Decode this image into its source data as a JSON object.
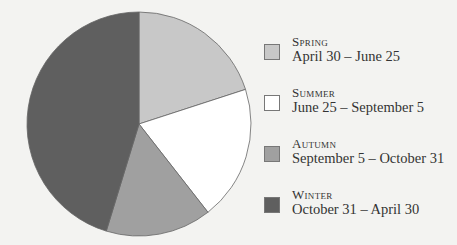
{
  "chart_data": {
    "type": "pie",
    "title": "",
    "slices": [
      {
        "name": "Spring",
        "range": "April 30 – June 25",
        "start_deg": 0,
        "end_deg": 72,
        "color": "#c8c8c8"
      },
      {
        "name": "Summer",
        "range": "June 25 – September 5",
        "start_deg": 72,
        "end_deg": 142,
        "color": "#ffffff"
      },
      {
        "name": "Autumn",
        "range": "September 5 – October 31",
        "start_deg": 142,
        "end_deg": 197,
        "color": "#a0a0a0"
      },
      {
        "name": "Winter",
        "range": "October 31 – April 30",
        "start_deg": 197,
        "end_deg": 360,
        "color": "#5f5f5f"
      }
    ],
    "legend_position": "right"
  },
  "legend": [
    {
      "name": "Spring",
      "range": "April 30 – June 25"
    },
    {
      "name": "Summer",
      "range": "June 25 – September 5"
    },
    {
      "name": "Autumn",
      "range": "September 5 – October 31"
    },
    {
      "name": "Winter",
      "range": "October 31 – April 30"
    }
  ]
}
